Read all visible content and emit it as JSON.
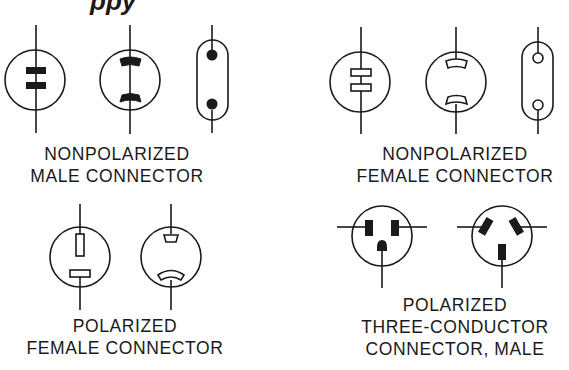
{
  "diagram": {
    "title_partial": "ppy",
    "stroke_color": "#1a1a1a",
    "groups": [
      {
        "id": "nonpolarized-male",
        "label_lines": [
          "NONPOLARIZED",
          "MALE CONNECTOR"
        ],
        "symbols": [
          "two-blade-round-filled",
          "curved-blade-round-filled",
          "capsule-two-pin-filled"
        ]
      },
      {
        "id": "nonpolarized-female",
        "label_lines": [
          "NONPOLARIZED",
          "FEMALE CONNECTOR"
        ],
        "symbols": [
          "two-slot-round-hollow",
          "curved-slot-round-hollow",
          "capsule-two-socket-hollow"
        ]
      },
      {
        "id": "polarized-female",
        "label_lines": [
          "POLARIZED",
          "FEMALE CONNECTOR"
        ],
        "symbols": [
          "vertical-horizontal-slot-hollow",
          "small-large-curved-slot-hollow"
        ]
      },
      {
        "id": "polarized-three-conductor-male",
        "label_lines": [
          "POLARIZED",
          "THREE-CONDUCTOR",
          "CONNECTOR, MALE"
        ],
        "symbols": [
          "parallel-blades-ground-pin",
          "angled-blades-ground-blade"
        ]
      }
    ]
  }
}
